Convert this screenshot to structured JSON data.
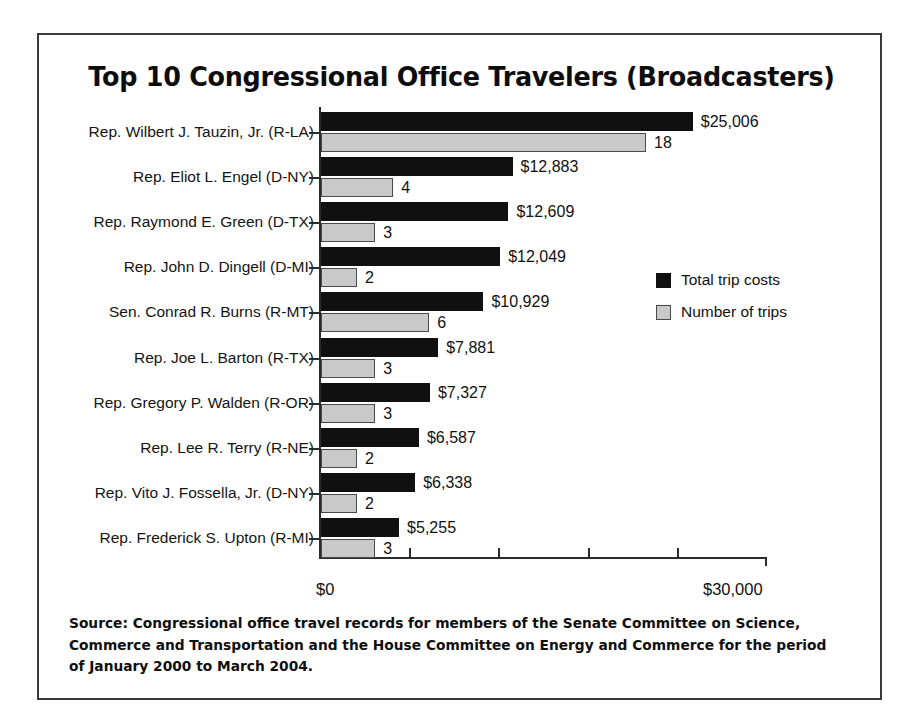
{
  "chart_data": {
    "type": "bar",
    "orientation": "horizontal",
    "title": "Top 10 Congressional Office Travelers (Broadcasters)",
    "xlabel": "",
    "ylabel": "",
    "xlim": [
      0,
      30000
    ],
    "grid": false,
    "legend_position": "middle-right",
    "axis_tick_labels": {
      "min": "$0",
      "max": "$30,000"
    },
    "categories": [
      "Rep. Wilbert J. Tauzin, Jr. (R-LA)",
      "Rep. Eliot L. Engel (D-NY)",
      "Rep. Raymond E. Green (D-TX)",
      "Rep. John D. Dingell (D-MI)",
      "Sen. Conrad R. Burns (R-MT)",
      "Rep. Joe L. Barton (R-TX)",
      "Rep. Gregory P. Walden (R-OR)",
      "Rep. Lee R. Terry (R-NE)",
      "Rep. Vito J. Fossella, Jr. (D-NY)",
      "Rep. Frederick S. Upton (R-MI)"
    ],
    "series": [
      {
        "name": "Total trip costs",
        "color": "#101010",
        "values": [
          25006,
          12883,
          12609,
          12049,
          10929,
          7881,
          7327,
          6587,
          6338,
          5255
        ],
        "value_labels": [
          "$25,006",
          "$12,883",
          "$12,609",
          "$12,049",
          "$10,929",
          "$7,881",
          "$7,327",
          "$6,587",
          "$6,338",
          "$5,255"
        ]
      },
      {
        "name": "Number of trips",
        "color": "#c9c9c9",
        "values": [
          18,
          4,
          3,
          2,
          6,
          3,
          3,
          2,
          2,
          3
        ],
        "value_labels": [
          "18",
          "4",
          "3",
          "2",
          "6",
          "3",
          "3",
          "2",
          "2",
          "3"
        ]
      }
    ]
  },
  "source_note": "Source: Congressional office travel records for members of the Senate Committee on Science, Commerce and Transportation and the House Committee on Energy and Commerce for the period of January 2000 to March 2004."
}
